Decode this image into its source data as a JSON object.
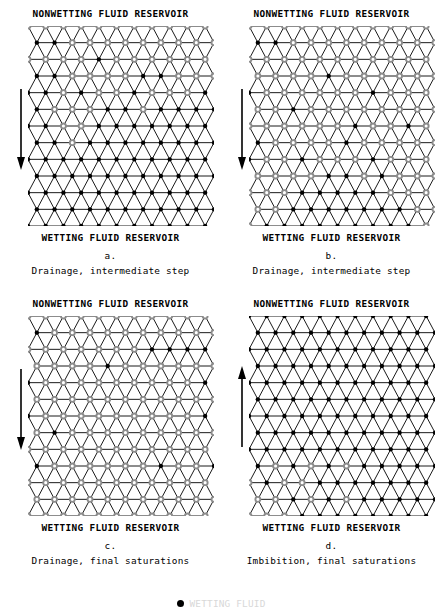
{
  "figure": {
    "reservoir_top_label": "NONWETTING FLUID RESERVOIR",
    "reservoir_bottom_label": "WETTING FLUID RESERVOIR",
    "colors": {
      "wetting_node": "#000000",
      "nonwetting_node": "#8c8c8c",
      "bond": "#000000",
      "background": "#ffffff"
    },
    "lattice": {
      "type": "triangular",
      "rows": 13,
      "columns": 11,
      "node_marker_wetting": "filled-circle",
      "node_marker_nonwetting": "open-hatched-circle"
    }
  },
  "legend": {
    "marker": "filled-circle",
    "label": "WETTING FLUID"
  },
  "panels": [
    {
      "id": "a",
      "letter": "a.",
      "caption": "Drainage, intermediate step",
      "arrow_direction": "down",
      "top_label": "NONWETTING FLUID RESERVOIR",
      "bottom_label": "WETTING FLUID RESERVOIR",
      "invaded_fraction": 0.26,
      "invaded_rows": [
        [
          1,
          1,
          1,
          1,
          1,
          1,
          1,
          1,
          1,
          1,
          1
        ],
        [
          0,
          0,
          1,
          1,
          1,
          1,
          1,
          1,
          1,
          1,
          1
        ],
        [
          1,
          1,
          1,
          1,
          0,
          1,
          1,
          1,
          1,
          1,
          1
        ],
        [
          0,
          0,
          1,
          1,
          1,
          1,
          0,
          0,
          1,
          1,
          1
        ],
        [
          0,
          0,
          1,
          0,
          1,
          1,
          0,
          1,
          1,
          1,
          0
        ],
        [
          0,
          1,
          1,
          1,
          0,
          0,
          1,
          0,
          0,
          0,
          0
        ],
        [
          0,
          0,
          1,
          1,
          0,
          0,
          0,
          0,
          0,
          0,
          0
        ],
        [
          0,
          0,
          1,
          0,
          0,
          0,
          0,
          0,
          0,
          0,
          0
        ],
        [
          0,
          0,
          0,
          0,
          0,
          0,
          0,
          0,
          0,
          0,
          0
        ],
        [
          0,
          0,
          0,
          0,
          0,
          0,
          0,
          0,
          0,
          0,
          0
        ],
        [
          0,
          0,
          0,
          0,
          0,
          0,
          0,
          0,
          0,
          0,
          0
        ],
        [
          0,
          0,
          0,
          0,
          0,
          0,
          0,
          0,
          0,
          0,
          0
        ],
        [
          0,
          0,
          0,
          0,
          0,
          0,
          0,
          0,
          0,
          0,
          0
        ]
      ]
    },
    {
      "id": "b",
      "letter": "b.",
      "caption": "Drainage, intermediate step",
      "arrow_direction": "down",
      "top_label": "NONWETTING FLUID RESERVOIR",
      "bottom_label": "WETTING FLUID RESERVOIR",
      "invaded_fraction": 0.55,
      "invaded_rows": [
        [
          1,
          1,
          1,
          1,
          1,
          1,
          1,
          1,
          1,
          1,
          1
        ],
        [
          0,
          0,
          1,
          1,
          1,
          1,
          1,
          1,
          1,
          1,
          1
        ],
        [
          1,
          1,
          1,
          1,
          1,
          1,
          1,
          1,
          1,
          1,
          1
        ],
        [
          1,
          1,
          1,
          1,
          0,
          1,
          1,
          1,
          1,
          1,
          1
        ],
        [
          0,
          1,
          1,
          1,
          1,
          1,
          1,
          0,
          1,
          1,
          1
        ],
        [
          1,
          1,
          0,
          1,
          1,
          1,
          1,
          1,
          1,
          1,
          1
        ],
        [
          1,
          1,
          1,
          1,
          1,
          1,
          0,
          1,
          1,
          0,
          1
        ],
        [
          0,
          1,
          1,
          1,
          1,
          0,
          1,
          1,
          1,
          1,
          1
        ],
        [
          0,
          1,
          1,
          0,
          1,
          1,
          1,
          0,
          1,
          1,
          1
        ],
        [
          1,
          1,
          1,
          1,
          0,
          0,
          1,
          0,
          1,
          1,
          1
        ],
        [
          1,
          1,
          1,
          0,
          0,
          0,
          0,
          0,
          1,
          1,
          1
        ],
        [
          1,
          1,
          0,
          0,
          0,
          0,
          0,
          0,
          0,
          1,
          1
        ],
        [
          1,
          0,
          0,
          0,
          0,
          0,
          0,
          0,
          0,
          0,
          1
        ]
      ]
    },
    {
      "id": "c",
      "letter": "c.",
      "caption": "Drainage, final saturations",
      "arrow_direction": "down",
      "top_label": "NONWETTING FLUID RESERVOIR",
      "bottom_label": "WETTING FLUID RESERVOIR",
      "invaded_fraction": 0.86,
      "invaded_rows": [
        [
          1,
          1,
          1,
          1,
          1,
          1,
          1,
          1,
          1,
          1,
          1
        ],
        [
          0,
          1,
          1,
          1,
          1,
          1,
          1,
          1,
          1,
          1,
          1
        ],
        [
          1,
          1,
          1,
          1,
          1,
          1,
          1,
          0,
          0,
          0,
          0
        ],
        [
          1,
          1,
          1,
          1,
          0,
          1,
          1,
          1,
          1,
          1,
          1
        ],
        [
          0,
          1,
          1,
          1,
          1,
          1,
          1,
          1,
          1,
          1,
          0
        ],
        [
          1,
          1,
          1,
          1,
          1,
          1,
          1,
          1,
          1,
          1,
          1
        ],
        [
          0,
          1,
          1,
          1,
          1,
          1,
          1,
          1,
          1,
          1,
          0
        ],
        [
          1,
          0,
          1,
          1,
          1,
          1,
          1,
          1,
          1,
          1,
          1
        ],
        [
          1,
          1,
          1,
          1,
          1,
          1,
          1,
          1,
          1,
          1,
          1
        ],
        [
          0,
          1,
          1,
          1,
          1,
          1,
          1,
          0,
          1,
          1,
          0
        ],
        [
          1,
          1,
          1,
          1,
          1,
          1,
          1,
          1,
          1,
          1,
          1
        ],
        [
          1,
          1,
          1,
          1,
          1,
          1,
          1,
          1,
          1,
          1,
          1
        ],
        [
          1,
          1,
          1,
          1,
          1,
          1,
          1,
          1,
          1,
          1,
          1
        ]
      ]
    },
    {
      "id": "d",
      "letter": "d.",
      "caption": "Imbibition, final saturations",
      "arrow_direction": "up",
      "top_label": "NONWETTING FLUID RESERVOIR",
      "bottom_label": "WETTING FLUID RESERVOIR",
      "invaded_fraction": 0.09,
      "invaded_rows": [
        [
          0,
          0,
          0,
          0,
          0,
          0,
          0,
          0,
          0,
          0,
          0
        ],
        [
          0,
          0,
          0,
          0,
          0,
          0,
          0,
          0,
          0,
          0,
          0
        ],
        [
          0,
          0,
          0,
          0,
          0,
          0,
          0,
          0,
          0,
          0,
          0
        ],
        [
          0,
          0,
          0,
          0,
          0,
          0,
          0,
          0,
          0,
          0,
          0
        ],
        [
          0,
          0,
          0,
          0,
          0,
          0,
          0,
          0,
          0,
          0,
          0
        ],
        [
          0,
          0,
          0,
          0,
          0,
          0,
          0,
          0,
          0,
          0,
          0
        ],
        [
          0,
          0,
          0,
          0,
          0,
          0,
          0,
          0,
          0,
          0,
          0
        ],
        [
          0,
          0,
          0,
          0,
          0,
          0,
          0,
          0,
          0,
          0,
          0
        ],
        [
          0,
          0,
          0,
          0,
          0,
          0,
          0,
          0,
          0,
          0,
          0
        ],
        [
          0,
          1,
          0,
          1,
          0,
          1,
          0,
          0,
          0,
          0,
          0
        ],
        [
          1,
          0,
          1,
          1,
          0,
          0,
          0,
          0,
          0,
          0,
          0
        ],
        [
          1,
          1,
          0,
          1,
          0,
          1,
          0,
          0,
          0,
          0,
          0
        ],
        [
          1,
          1,
          1,
          0,
          0,
          0,
          0,
          0,
          0,
          0,
          0
        ]
      ]
    }
  ]
}
